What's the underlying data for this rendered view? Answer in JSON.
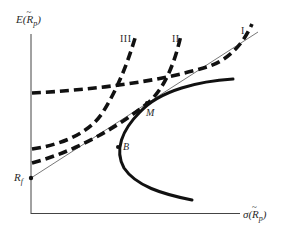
{
  "diagram": {
    "title": "",
    "axes": {
      "y_label": {
        "prefix": "E(",
        "var": "R",
        "tilde": "~",
        "sub": "p",
        "suffix": ")"
      },
      "x_label": {
        "prefix": "σ(",
        "var": "R",
        "tilde": "~",
        "sub": "p",
        "suffix": ")"
      }
    },
    "points": {
      "rf": {
        "label": "R",
        "sub": "f"
      },
      "m": {
        "label": "M"
      },
      "b": {
        "label": "B"
      }
    },
    "indifference_curves": [
      {
        "id": "I",
        "label": "I"
      },
      {
        "id": "II",
        "label": "II"
      },
      {
        "id": "III",
        "label": "III"
      }
    ],
    "colors": {
      "ink": "#1a1a1a",
      "thin_line": "#555555",
      "background": "#ffffff"
    }
  }
}
